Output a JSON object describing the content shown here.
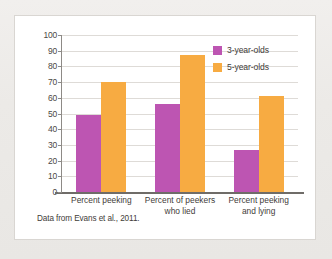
{
  "figure": {
    "caption": "Data from Evans et al., 2011.",
    "card_background": "#ffffff",
    "page_background": "#eeecea"
  },
  "legend": {
    "position": "top-right",
    "entries": [
      {
        "label": "3-year-olds",
        "color": "#bd55b2"
      },
      {
        "label": "5-year-olds",
        "color": "#f7ab42"
      }
    ]
  },
  "axis": {
    "y_ticks": [
      "100",
      "90",
      "80",
      "70",
      "60",
      "50",
      "40",
      "30",
      "20",
      "10",
      "0"
    ]
  },
  "chart_data": {
    "type": "bar",
    "title": "",
    "subtitle": "",
    "xlabel": "",
    "ylabel": "",
    "ylim": [
      0,
      100
    ],
    "ytick_step": 10,
    "grid": true,
    "legend_position": "top-right",
    "annotation": "Data from Evans et al., 2011.",
    "categories": [
      "Percent peeking",
      "Percent of peekers who lied",
      "Percent peeking and lying"
    ],
    "category_lines": [
      [
        "Percent peeking"
      ],
      [
        "Percent of peekers",
        "who lied"
      ],
      [
        "Percent peeking",
        "and lying"
      ]
    ],
    "series": [
      {
        "name": "3-year-olds",
        "color": "#bd55b2",
        "values": [
          49,
          56,
          27
        ]
      },
      {
        "name": "5-year-olds",
        "color": "#f7ab42",
        "values": [
          70,
          87,
          61
        ]
      }
    ]
  }
}
